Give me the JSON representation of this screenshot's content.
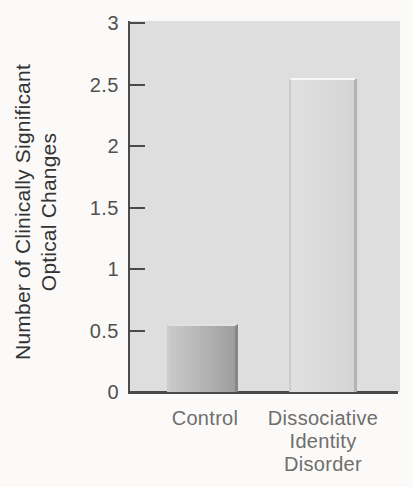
{
  "figure": {
    "ylabel_display": "Number of Clinically Significant\nOptical Changes",
    "y_tick_labels": [
      "3",
      "2.5",
      "2",
      "1.5",
      "1",
      "0.5",
      "0"
    ],
    "x_tick_display": [
      "Control",
      "Dissociative\nIdentity\nDisorder"
    ]
  },
  "colors": {
    "page_bg": "#fbfaf8",
    "plot_bg": "#dedede",
    "axis": "#4a4a4a",
    "y_tick_text": "#515151",
    "ylabel_text": "#333333",
    "xlabel_text": "#6e6e6e"
  },
  "chart_data": {
    "type": "bar",
    "title": "",
    "xlabel": "",
    "ylabel": "Number of Clinically Significant Optical Changes",
    "categories": [
      "Control",
      "Dissociative Identity Disorder"
    ],
    "values": [
      0.55,
      2.55
    ],
    "ylim": [
      0,
      3
    ],
    "yticks": [
      0,
      0.5,
      1,
      1.5,
      2,
      2.5,
      3
    ],
    "grid": false,
    "legend": "none",
    "tick_direction": "in",
    "bar_styles": [
      {
        "name": "control",
        "fill": "#b3b3b3",
        "fill_left": "#c9c9c9",
        "fill_right": "#9e9e9e",
        "edge_left": "#cdcdcd",
        "edge_right": "#868686",
        "edge_top": "#e2e2e2"
      },
      {
        "name": "dissociative-identity-disorder",
        "fill": "#dadada",
        "fill_left": "#e0e0e0",
        "fill_right": "#d4d4d4",
        "edge_left": "#cccccc",
        "edge_right": "#b3b3b3",
        "edge_top": "#f7f7f7"
      }
    ]
  }
}
